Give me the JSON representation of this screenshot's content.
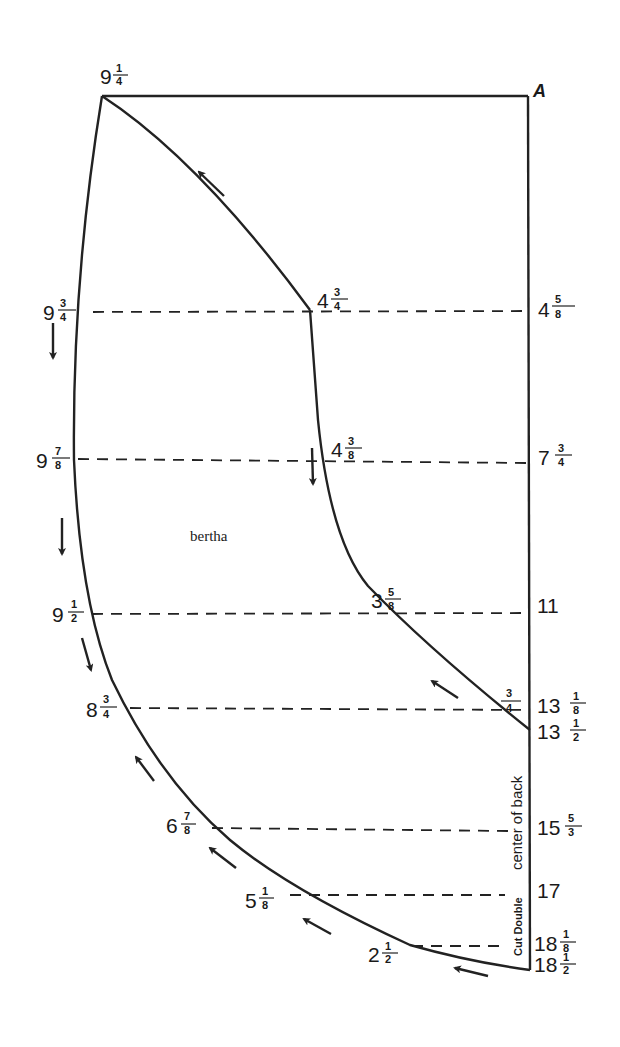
{
  "diagram": {
    "title": "bertha",
    "corner_label": "A",
    "edge_labels": {
      "center_of_back": "center of back",
      "cut_double": "Cut Double"
    },
    "top_left_measure": {
      "whole": "9",
      "num": "1",
      "den": "4"
    },
    "left_measures": [
      {
        "whole": "9",
        "num": "3",
        "den": "4"
      },
      {
        "whole": "9",
        "num": "7",
        "den": "8"
      },
      {
        "whole": "9",
        "num": "1",
        "den": "2"
      },
      {
        "whole": "8",
        "num": "3",
        "den": "4"
      },
      {
        "whole": "6",
        "num": "7",
        "den": "8"
      },
      {
        "whole": "5",
        "num": "1",
        "den": "8"
      },
      {
        "whole": "2",
        "num": "1",
        "den": "2"
      }
    ],
    "inner_measures": [
      {
        "whole": "4",
        "num": "3",
        "den": "4"
      },
      {
        "whole": "4",
        "num": "3",
        "den": "8"
      },
      {
        "whole": "3",
        "num": "5",
        "den": "8"
      },
      {
        "whole": "",
        "num": "3",
        "den": "4"
      }
    ],
    "right_measures": [
      {
        "whole": "4",
        "num": "5",
        "den": "8"
      },
      {
        "whole": "7",
        "num": "3",
        "den": "4"
      },
      {
        "whole": "11",
        "num": "",
        "den": ""
      },
      {
        "whole": "13",
        "num": "1",
        "den": "8"
      },
      {
        "whole": "13",
        "num": "1",
        "den": "2"
      },
      {
        "whole": "15",
        "num": "5",
        "den": "3"
      },
      {
        "whole": "17",
        "num": "",
        "den": ""
      },
      {
        "whole": "18",
        "num": "1",
        "den": "8"
      },
      {
        "whole": "18",
        "num": "1",
        "den": "2"
      }
    ]
  }
}
